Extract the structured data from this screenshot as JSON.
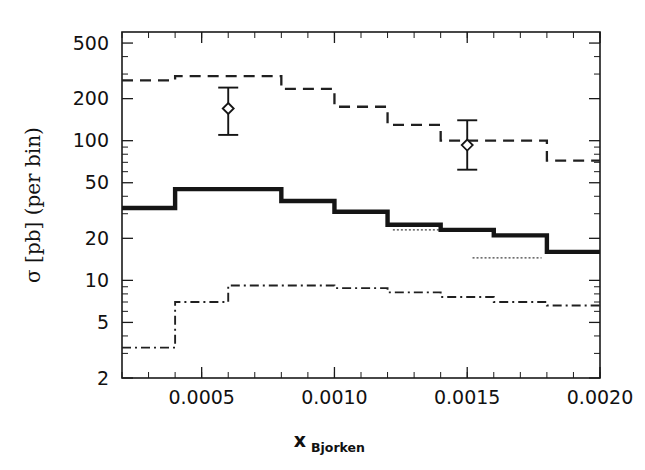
{
  "figure": {
    "title": "",
    "background": "#ffffff",
    "ink_color": "#151515"
  },
  "axes": {
    "y_title_sigma": "σ [pb]  (per bin)",
    "y_title_part1": "σ [pb]",
    "y_title_part2": "(per bin)",
    "x_title_main": "x",
    "x_title_sub": "Bjorken",
    "y_scale": "log",
    "x_scale": "linear",
    "y_ticklabels": [
      "500",
      "200",
      "100",
      "50",
      "20",
      "10",
      "5",
      "2"
    ],
    "x_ticklabels": [
      "0.0005",
      "0.0010",
      "0.0015",
      "0.0020"
    ]
  },
  "chart_data": {
    "type": "line",
    "title": "",
    "xlabel": "x_Bjorken",
    "ylabel": "sigma [pb] (per bin)",
    "yscale": "log",
    "xscale": "linear",
    "xlim": [
      0.0002,
      0.002
    ],
    "ylim": [
      2,
      600
    ],
    "grid": false,
    "legend": "none",
    "y_major_ticks": [
      2,
      5,
      10,
      20,
      50,
      100,
      200,
      500
    ],
    "y_minor_ticks": [
      3,
      4,
      6,
      7,
      8,
      9,
      30,
      40,
      60,
      70,
      80,
      90,
      300,
      400
    ],
    "x_major_ticks": [
      0.0005,
      0.001,
      0.0015,
      0.002
    ],
    "x_minor_tick_step": 0.0001,
    "bin_edges": [
      0.0002,
      0.0004,
      0.0006,
      0.0008,
      0.001,
      0.0012,
      0.0014,
      0.0016,
      0.0018,
      0.002
    ],
    "series": [
      {
        "name": "upper-prediction",
        "style": "dashed",
        "values": [
          270,
          290,
          290,
          235,
          235,
          175,
          175,
          130,
          130,
          100,
          100,
          72,
          72
        ]
      },
      {
        "name": "central-prediction",
        "style": "solid-thick",
        "values": [
          33,
          45,
          45,
          45,
          37,
          37,
          31,
          31,
          25,
          25,
          21,
          21,
          16,
          16
        ]
      },
      {
        "name": "lower-prediction",
        "style": "dash-dot",
        "values": [
          3.3,
          7.0,
          7.0,
          9.2,
          9.2,
          8.8,
          8.8,
          8.2,
          8.2,
          7.3,
          7.3,
          6.6,
          6.6
        ]
      },
      {
        "name": "short-dotted-segment-a",
        "style": "dotted",
        "values": [
          23,
          23
        ]
      },
      {
        "name": "short-dotted-segment-b",
        "style": "dotted",
        "values": [
          14.5,
          14.5
        ]
      }
    ],
    "upper_steps": [
      {
        "x0": 0.0002,
        "x1": 0.0004,
        "y": 270
      },
      {
        "x0": 0.0004,
        "x1": 0.0008,
        "y": 290
      },
      {
        "x0": 0.0008,
        "x1": 0.001,
        "y": 235
      },
      {
        "x0": 0.001,
        "x1": 0.0012,
        "y": 175
      },
      {
        "x0": 0.0012,
        "x1": 0.0014,
        "y": 130
      },
      {
        "x0": 0.0014,
        "x1": 0.0018,
        "y": 100
      },
      {
        "x0": 0.0018,
        "x1": 0.002,
        "y": 72
      }
    ],
    "central_steps": [
      {
        "x0": 0.0002,
        "x1": 0.0004,
        "y": 33
      },
      {
        "x0": 0.0004,
        "x1": 0.0008,
        "y": 45
      },
      {
        "x0": 0.0008,
        "x1": 0.001,
        "y": 37
      },
      {
        "x0": 0.001,
        "x1": 0.0012,
        "y": 31
      },
      {
        "x0": 0.0012,
        "x1": 0.0014,
        "y": 25
      },
      {
        "x0": 0.0014,
        "x1": 0.0016,
        "y": 23
      },
      {
        "x0": 0.0016,
        "x1": 0.0018,
        "y": 21
      },
      {
        "x0": 0.0018,
        "x1": 0.002,
        "y": 16
      }
    ],
    "lower_steps": [
      {
        "x0": 0.0002,
        "x1": 0.0004,
        "y": 3.3
      },
      {
        "x0": 0.0004,
        "x1": 0.0006,
        "y": 7.0
      },
      {
        "x0": 0.0006,
        "x1": 0.001,
        "y": 9.2
      },
      {
        "x0": 0.001,
        "x1": 0.0012,
        "y": 8.8
      },
      {
        "x0": 0.0012,
        "x1": 0.0014,
        "y": 8.2
      },
      {
        "x0": 0.0014,
        "x1": 0.0016,
        "y": 7.6
      },
      {
        "x0": 0.0016,
        "x1": 0.0018,
        "y": 7.0
      },
      {
        "x0": 0.0018,
        "x1": 0.002,
        "y": 6.6
      }
    ],
    "dotted_segments": [
      {
        "x0": 0.00122,
        "x1": 0.00148,
        "y": 23
      },
      {
        "x0": 0.00152,
        "x1": 0.00178,
        "y": 14.5
      }
    ],
    "data_points": [
      {
        "x": 0.0006,
        "y": 170,
        "yerr_low": 110,
        "yerr_high": 240,
        "marker": "diamond"
      },
      {
        "x": 0.0015,
        "y": 93,
        "yerr_low": 62,
        "yerr_high": 140,
        "marker": "diamond"
      }
    ]
  }
}
